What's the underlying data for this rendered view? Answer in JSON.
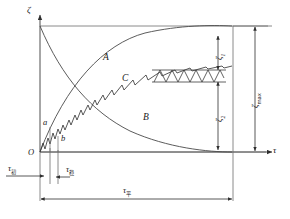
{
  "figure": {
    "type": "engineering-line-diagram",
    "background_color": "#ffffff",
    "line_color": "#3a3a3a",
    "text_color": "#1a1a1a"
  },
  "axes": {
    "y_axis_label": "ζ",
    "x_axis_label": "τ",
    "origin_label": "O",
    "y_axis_arrow": "up",
    "x_axis_arrow": "right"
  },
  "curve_labels": {
    "upper": "A",
    "lower": "B",
    "stepped": "C"
  },
  "point_labels": {
    "a": "a",
    "b": "b"
  },
  "time_dimensions": [
    {
      "name": "tau-initial",
      "symbol": "τ",
      "subscript": "初",
      "full": "τ初",
      "position": "left-of-axis"
    },
    {
      "name": "tau-stable",
      "symbol": "τ",
      "subscript": "稳",
      "full": "τ稳",
      "position": "near-origin"
    },
    {
      "name": "tau-total",
      "symbol": "τ",
      "subscript": "平",
      "full": "τ平",
      "position": "bottom-span"
    }
  ],
  "deformation_dimensions": [
    {
      "name": "zeta-1",
      "symbol": "ζ",
      "subscript": "1",
      "full": "ζ1",
      "position": "upper-right-inner"
    },
    {
      "name": "zeta-2",
      "symbol": "ζ",
      "subscript": "2",
      "full": "ζ2",
      "position": "lower-right-inner"
    },
    {
      "name": "zeta-max",
      "symbol": "ζ",
      "subscript": "max",
      "full": "ζmax",
      "position": "far-right-outer"
    }
  ]
}
